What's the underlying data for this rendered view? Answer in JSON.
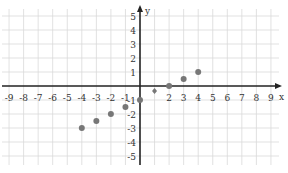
{
  "chart_data": {
    "type": "scatter",
    "title": "",
    "xlabel": "x",
    "ylabel": "y",
    "xlim": [
      -9,
      9
    ],
    "ylim": [
      -5,
      5
    ],
    "grid": true,
    "legend": null,
    "x_ticks": [
      "-9",
      "-8",
      "-7",
      "-6",
      "-5",
      "-4",
      "-3",
      "-2",
      "-1",
      "",
      "2",
      "3",
      "4",
      "5",
      "6",
      "7",
      "8",
      "9"
    ],
    "y_ticks": [
      "5",
      "4",
      "3",
      "2",
      "1",
      "-1",
      "-2",
      "-3",
      "-4",
      "-5"
    ],
    "series": [
      {
        "name": "points",
        "color": "#777777",
        "x": [
          -4,
          -3,
          -2,
          -1,
          0,
          1,
          2,
          3,
          4
        ],
        "y": [
          -3,
          -2.5,
          -2,
          -1.5,
          -1,
          -0.5,
          0,
          0.5,
          1
        ]
      }
    ]
  },
  "colors": {
    "grid": "#d9d9d9",
    "axis": "#222222",
    "point": "#777777",
    "background": "#ffffff"
  }
}
